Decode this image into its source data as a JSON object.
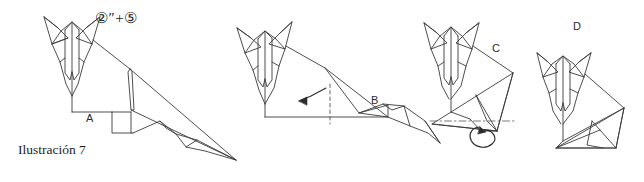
{
  "figure": {
    "caption": "Ilustración 7",
    "step_annotation": "②″+⑤",
    "background_color": "#ffffff",
    "line_color": "#3a3a3a",
    "text_color": "#222222",
    "steps": [
      {
        "id": "A",
        "label": "A",
        "note": "standing fox body, front view head with ears, long pointed tail"
      },
      {
        "id": "B",
        "label": "B",
        "note": "dashed vertical fold line on rear with curved arrow pointing left"
      },
      {
        "id": "C",
        "label": "C",
        "note": "folded haunch with dash-dot axis line and circular rotation arrow"
      },
      {
        "id": "D",
        "label": "D",
        "note": "completed seated fox"
      }
    ],
    "annotations": {
      "dashed_fold_line": "valley-fold",
      "curved_arrow": "fold-direction-arrow",
      "loop_arrow": "rotate-arrow",
      "axis_line": "center-axis-dash-dot"
    }
  }
}
